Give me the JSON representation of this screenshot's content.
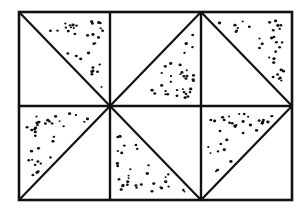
{
  "figure": {
    "colors": {
      "background": "#ffffff",
      "ink": "#111111"
    },
    "frame": {
      "x": 19,
      "y": 12,
      "width": 273,
      "height": 188
    },
    "columns": [
      19,
      110,
      201,
      292
    ],
    "rows": [
      12,
      106,
      200
    ],
    "cells": [
      {
        "row": 0,
        "col": 0,
        "diagonal": "top-left to bottom-right",
        "stippled_half": "upper-right"
      },
      {
        "row": 0,
        "col": 1,
        "diagonal": "bottom-left to top-right",
        "stippled_half": "lower-right"
      },
      {
        "row": 0,
        "col": 2,
        "diagonal": "top-left to bottom-right",
        "stippled_half": "upper-right"
      },
      {
        "row": 1,
        "col": 0,
        "diagonal": "bottom-left to top-right",
        "stippled_half": "upper-left"
      },
      {
        "row": 1,
        "col": 1,
        "diagonal": "top-left to bottom-right",
        "stippled_half": "lower-left"
      },
      {
        "row": 1,
        "col": 2,
        "diagonal": "bottom-left to top-right",
        "stippled_half": "upper-left"
      }
    ]
  }
}
